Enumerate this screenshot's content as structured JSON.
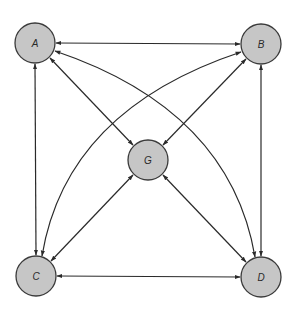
{
  "diagram": {
    "type": "directed-graph",
    "style": {
      "node_fill": "#c6c6c6",
      "node_stroke": "#3a3a3a",
      "edge_color": "#2a2a2a",
      "background": "#ffffff"
    },
    "nodes": [
      {
        "id": "A",
        "label": "A",
        "x": 35,
        "y": 43,
        "r": 20
      },
      {
        "id": "B",
        "label": "B",
        "x": 261,
        "y": 44,
        "r": 20
      },
      {
        "id": "G",
        "label": "G",
        "x": 148,
        "y": 160,
        "r": 20
      },
      {
        "id": "C",
        "label": "C",
        "x": 36,
        "y": 276,
        "r": 20
      },
      {
        "id": "D",
        "label": "D",
        "x": 261,
        "y": 277,
        "r": 20
      }
    ],
    "edges": [
      {
        "from": "A",
        "to": "B",
        "bidirectional": true,
        "shape": "straight"
      },
      {
        "from": "A",
        "to": "C",
        "bidirectional": true,
        "shape": "straight"
      },
      {
        "from": "B",
        "to": "D",
        "bidirectional": true,
        "shape": "straight"
      },
      {
        "from": "C",
        "to": "D",
        "bidirectional": true,
        "shape": "straight"
      },
      {
        "from": "A",
        "to": "G",
        "bidirectional": true,
        "shape": "straight"
      },
      {
        "from": "B",
        "to": "G",
        "bidirectional": true,
        "shape": "straight"
      },
      {
        "from": "C",
        "to": "G",
        "bidirectional": true,
        "shape": "straight"
      },
      {
        "from": "D",
        "to": "G",
        "bidirectional": true,
        "shape": "straight"
      },
      {
        "from": "A",
        "to": "D",
        "bidirectional": true,
        "shape": "curved"
      },
      {
        "from": "B",
        "to": "C",
        "bidirectional": true,
        "shape": "curved"
      }
    ]
  }
}
